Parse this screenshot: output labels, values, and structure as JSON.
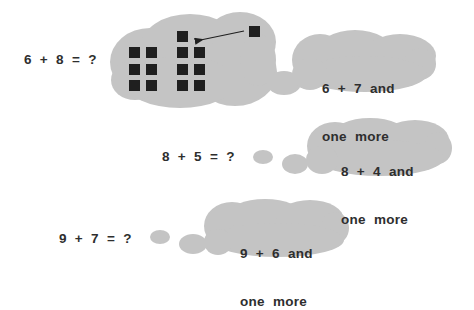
{
  "colors": {
    "cloud": "#c4c4c4",
    "text": "#2e2e2e",
    "square": "#1f1f1f"
  },
  "problems": [
    {
      "equation": "6 + 8 = ?",
      "thought_line1": "6 + 7 and",
      "thought_line2": "one more",
      "visual": {
        "left_group_count": 6,
        "right_group_count": 7,
        "moved_square_count": 1,
        "arrow": "moves one square from 8-group to 7-group"
      }
    },
    {
      "equation": "8 + 5 = ?",
      "thought_line1": "8 + 4 and",
      "thought_line2": "one more"
    },
    {
      "equation": "9 + 7 = ?",
      "thought_line1": "9 + 6 and",
      "thought_line2": "one more"
    }
  ]
}
